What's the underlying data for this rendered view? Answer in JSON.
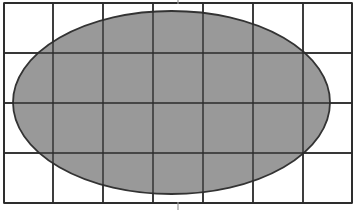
{
  "figure": {
    "canvas": {
      "width": 355,
      "height": 210,
      "background_color": "#ffffff"
    },
    "grid": {
      "name": "rectangular-grid",
      "left": 4,
      "top": 3,
      "right": 352,
      "bottom": 203,
      "columns": 7,
      "rows": 4,
      "cell_width": 50,
      "cell_height": 50,
      "vertical_line_x": [
        4,
        53,
        103,
        153,
        203,
        253,
        303,
        352
      ],
      "horizontal_line_y": [
        3,
        53,
        103,
        153,
        203
      ],
      "line_color": "#2b2b2b",
      "line_width": 1.4,
      "border_color": "#2b2b2b",
      "border_width": 1.6,
      "fill_color": "#ffffff"
    },
    "ellipse": {
      "name": "shaded-ellipse",
      "center_x": 171.5,
      "center_y": 102.5,
      "radius_x": 158.5,
      "radius_y": 91.5,
      "left": 13,
      "right": 330,
      "top": 11,
      "bottom": 194,
      "fill_color": "#999999",
      "stroke_color": "#333333",
      "stroke_width": 1.8
    },
    "ticks": [
      {
        "name": "center-tick-top",
        "x": 178,
        "y_start": 0,
        "y_end": 4,
        "color": "#9a9a9a",
        "width": 1.2
      },
      {
        "name": "center-tick-bottom",
        "x": 178,
        "y_start": 202,
        "y_end": 210,
        "color": "#9a9a9a",
        "width": 1.2
      }
    ]
  }
}
